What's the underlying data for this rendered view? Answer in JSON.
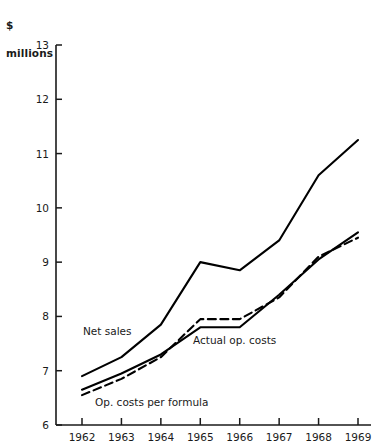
{
  "chart_data": {
    "type": "line",
    "title": "",
    "subtitle": "",
    "unit_label": "$\nmillions",
    "unit_label_line1": "$",
    "unit_label_line2": "millions",
    "xlabel": "",
    "ylabel": "$ millions",
    "categories": [
      "1962",
      "1963",
      "1964",
      "1965",
      "1966",
      "1967",
      "1968",
      "1969"
    ],
    "x": [
      1962,
      1963,
      1964,
      1965,
      1966,
      1967,
      1968,
      1969
    ],
    "xlim": [
      1962,
      1969
    ],
    "ylim": [
      6,
      13
    ],
    "yticks": [
      6,
      7,
      8,
      9,
      10,
      11,
      12,
      13
    ],
    "ytick_labels": [
      "6",
      "7",
      "8",
      "9",
      "10",
      "11",
      "12",
      "13"
    ],
    "grid": false,
    "legend_position": "inline-annotations",
    "series": [
      {
        "name": "Net sales",
        "style": "solid",
        "color": "#000000",
        "values": [
          6.9,
          7.25,
          7.85,
          9.0,
          8.85,
          9.4,
          10.6,
          11.25
        ]
      },
      {
        "name": "Actual op. costs",
        "style": "solid",
        "color": "#000000",
        "values": [
          6.65,
          6.95,
          7.3,
          7.8,
          7.8,
          8.4,
          9.05,
          9.55
        ]
      },
      {
        "name": "Op. costs per formula",
        "style": "dashed",
        "color": "#000000",
        "values": [
          6.55,
          6.85,
          7.25,
          7.95,
          7.95,
          8.35,
          9.1,
          9.45
        ]
      }
    ],
    "annotations": [
      {
        "text": "Net sales",
        "x_px": 83,
        "y_px": 335
      },
      {
        "text": "Actual op. costs",
        "x_px": 193,
        "y_px": 344
      },
      {
        "text": "Op. costs per formula",
        "x_px": 95,
        "y_px": 406
      }
    ]
  }
}
